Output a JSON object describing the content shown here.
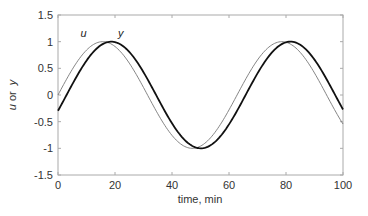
{
  "chart_data": {
    "type": "line",
    "title": "",
    "xlabel": "time, min",
    "ylabel_parts": [
      "u",
      " or ",
      "y"
    ],
    "ylabel": "u or y",
    "xlim": [
      0,
      100
    ],
    "ylim": [
      -1.5,
      1.5
    ],
    "xticks": [
      0,
      20,
      40,
      60,
      80,
      100
    ],
    "yticks": [
      -1.5,
      -1,
      -0.5,
      0,
      0.5,
      1,
      1.5
    ],
    "xtick_labels": [
      "0",
      "20",
      "40",
      "60",
      "80",
      "100"
    ],
    "ytick_labels": [
      "-1.5",
      "-1",
      "-0.5",
      "0",
      "0.5",
      "1",
      "1.5"
    ],
    "grid": false,
    "legend": "inline labels near first peak",
    "series": [
      {
        "name": "u",
        "style": "thin gray line",
        "color": "#777777",
        "description": "sin(0.1 t)",
        "x": [
          0,
          5,
          10,
          15,
          20,
          25,
          30,
          35,
          40,
          45,
          50,
          55,
          60,
          65,
          70,
          75,
          80,
          85,
          90,
          95,
          100
        ],
        "values": [
          0.0,
          0.48,
          0.84,
          1.0,
          0.91,
          0.6,
          0.14,
          -0.35,
          -0.76,
          -0.98,
          -0.96,
          -0.71,
          -0.28,
          0.22,
          0.66,
          0.94,
          0.99,
          0.8,
          0.41,
          -0.08,
          -0.54
        ]
      },
      {
        "name": "y",
        "style": "thick black line",
        "color": "#111111",
        "description": "sin(0.1 t - 0.3), lags u by ~3 min",
        "x": [
          0,
          5,
          10,
          15,
          20,
          25,
          30,
          35,
          40,
          45,
          50,
          55,
          60,
          65,
          70,
          75,
          80,
          85,
          90,
          95,
          100
        ],
        "values": [
          -0.3,
          0.2,
          0.64,
          0.93,
          0.99,
          0.81,
          0.43,
          -0.05,
          -0.52,
          -0.88,
          -1.0,
          -0.86,
          -0.49,
          -0.02,
          0.45,
          0.84,
          0.99,
          0.91,
          0.6,
          0.14,
          -0.28
        ]
      }
    ],
    "annotations": [
      {
        "text": "u",
        "x": 9,
        "y": 1.08
      },
      {
        "text": "y",
        "x": 22,
        "y": 1.08
      }
    ]
  }
}
